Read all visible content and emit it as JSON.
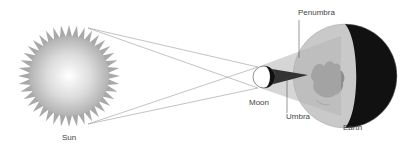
{
  "diagram": {
    "labels": {
      "sun": "Sun",
      "moon": "Moon",
      "earth": "Earth",
      "penumbra": "Penumbra",
      "umbra": "Umbra"
    },
    "colors": {
      "background": "#ffffff",
      "sun_center": "#ffffff",
      "sun_edge": "#b0b0b0",
      "sun_rays": "#a8a8a8",
      "rays_lines": "#999999",
      "penumbra": "#b4b4b4",
      "umbra": "#3a3a3a",
      "moon_lit": "#ffffff",
      "moon_dark": "#111111",
      "earth_day": "#c8c8c8",
      "earth_land": "#8c8c8c",
      "earth_night": "#111111",
      "label_text": "#444444",
      "leader_line": "#555555"
    }
  }
}
